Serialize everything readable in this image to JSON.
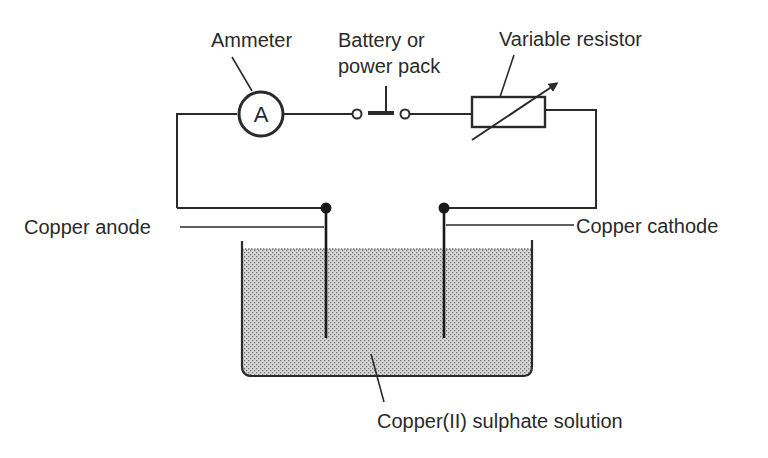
{
  "diagram": {
    "labels": {
      "ammeter": "Ammeter",
      "battery_line1": "Battery or",
      "battery_line2": "power pack",
      "variable_resistor": "Variable resistor",
      "copper_anode": "Copper anode",
      "copper_cathode": "Copper cathode",
      "solution": "Copper(II) sulphate solution"
    },
    "ammeter_symbol": "A",
    "colors": {
      "ink": "#2a2a2a",
      "solution_fill": "#c8c8c8",
      "background": "#ffffff"
    },
    "components": [
      {
        "name": "ammeter",
        "type": "meter"
      },
      {
        "name": "battery",
        "type": "cell"
      },
      {
        "name": "variable-resistor",
        "type": "resistor"
      },
      {
        "name": "copper-anode",
        "type": "electrode"
      },
      {
        "name": "copper-cathode",
        "type": "electrode"
      },
      {
        "name": "beaker",
        "type": "container"
      }
    ]
  }
}
